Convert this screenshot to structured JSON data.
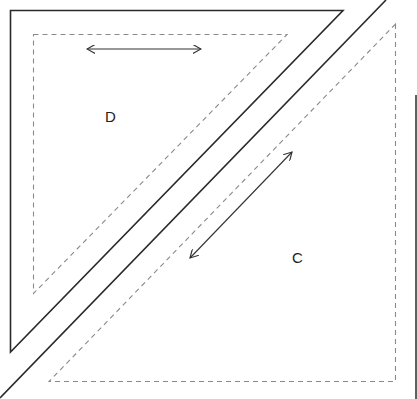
{
  "diagram": {
    "type": "quilt-block-template",
    "pieces": [
      {
        "id": "D",
        "label": "D",
        "shape": "right-triangle",
        "corner": "top-left",
        "grain_arrow": "horizontal"
      },
      {
        "id": "C",
        "label": "C",
        "shape": "right-triangle",
        "corner": "bottom-right",
        "grain_arrow": "diagonal"
      }
    ],
    "line_styles": {
      "cut_line": "solid",
      "seam_line": "dashed"
    },
    "colors": {
      "background": "#ffffff",
      "cut_line": "#2a2a2a",
      "seam_line": "#8a8a8a",
      "arrow": "#333333",
      "label": "#222222"
    }
  }
}
